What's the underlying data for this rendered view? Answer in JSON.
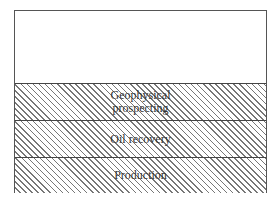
{
  "diagram": {
    "type": "stratified layers",
    "layers": [
      {
        "label_line1": "Geophysical",
        "label_line2": "prospecting"
      },
      {
        "label": "Oil recovery"
      },
      {
        "label": "Production"
      }
    ],
    "colors": {
      "border": "#444444",
      "hatch": "#777777",
      "background": "#ffffff"
    }
  }
}
